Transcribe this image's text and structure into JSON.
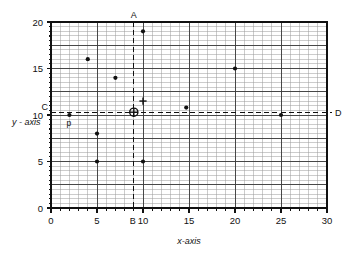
{
  "chart_data": {
    "type": "scatter",
    "title": "",
    "xlabel": "x-axis",
    "ylabel": "y - axis",
    "xlim": [
      0,
      30
    ],
    "ylim": [
      0,
      20
    ],
    "xticks": [
      0,
      5,
      10,
      15,
      20,
      25,
      30
    ],
    "xtick_labels": [
      "0",
      "5",
      "10",
      "15",
      "20",
      "25",
      "30"
    ],
    "yticks": [
      0,
      5,
      10,
      15,
      20
    ],
    "ytick_labels": [
      "0",
      "5",
      "10",
      "15",
      "20"
    ],
    "grid": true,
    "grid_minor_x_step": 1,
    "grid_minor_y_step": 0.5,
    "grid_major_x_step": 5,
    "grid_major_y_step": 2.5,
    "legend": "none",
    "points": [
      {
        "x": 2,
        "y": 10,
        "label": "p",
        "marker": "dot"
      },
      {
        "x": 4,
        "y": 16,
        "label": "",
        "marker": "dot"
      },
      {
        "x": 5,
        "y": 8,
        "label": "",
        "marker": "dot"
      },
      {
        "x": 5,
        "y": 5,
        "label": "",
        "marker": "dot"
      },
      {
        "x": 7,
        "y": 14,
        "label": "",
        "marker": "dot"
      },
      {
        "x": 10,
        "y": 19,
        "label": "",
        "marker": "dot"
      },
      {
        "x": 10,
        "y": 5,
        "label": "",
        "marker": "dot"
      },
      {
        "x": 14.7,
        "y": 10.8,
        "label": "",
        "marker": "dot"
      },
      {
        "x": 20,
        "y": 15,
        "label": "",
        "marker": "dot"
      },
      {
        "x": 25,
        "y": 10,
        "label": "",
        "marker": "dot"
      },
      {
        "x": 10,
        "y": 11.5,
        "label": "",
        "marker": "plus"
      }
    ],
    "annotations": {
      "vertical_line": {
        "x": 9,
        "style": "dashed",
        "top_label": "A",
        "bottom_label": "B"
      },
      "horizontal_line": {
        "y": 10.3,
        "style": "dashed",
        "left_label": "C",
        "right_label": "D"
      },
      "centroid_marker": {
        "x": 9,
        "y": 10.3,
        "marker": "circled-plus"
      }
    }
  },
  "labels": {
    "x_axis_title": "x-axis",
    "y_axis_title": "y - axis",
    "point_p": "p",
    "ref_a": "A",
    "ref_b": "B",
    "ref_c": "C",
    "ref_d": "D",
    "x_0": "0",
    "x_5": "5",
    "x_10": "10",
    "x_15": "15",
    "x_20": "20",
    "x_25": "25",
    "x_30": "30",
    "y_0": "0",
    "y_5": "5",
    "y_10": "10",
    "y_15": "15",
    "y_20": "20"
  },
  "colors": {
    "background": "#ffffff",
    "ink": "#111111",
    "minor_grid": "#9a9a9a",
    "major_grid": "#3a3a3a"
  }
}
